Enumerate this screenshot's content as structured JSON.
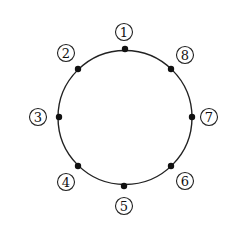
{
  "diagram": {
    "type": "circle-with-labeled-points",
    "circle": {
      "cx": 125,
      "cy": 117.5,
      "r": 67,
      "stroke": "#222222"
    },
    "points": [
      {
        "id": "1",
        "label": "1",
        "x": 125,
        "y": 49,
        "lx": 124,
        "ly": 32
      },
      {
        "id": "2",
        "label": "2",
        "x": 78,
        "y": 69,
        "lx": 66,
        "ly": 53
      },
      {
        "id": "3",
        "label": "3",
        "x": 59,
        "y": 117,
        "lx": 38,
        "ly": 117
      },
      {
        "id": "4",
        "label": "4",
        "x": 78,
        "y": 166,
        "lx": 66,
        "ly": 182
      },
      {
        "id": "5",
        "label": "5",
        "x": 124,
        "y": 186,
        "lx": 124,
        "ly": 206
      },
      {
        "id": "6",
        "label": "6",
        "x": 171,
        "y": 166,
        "lx": 185,
        "ly": 181
      },
      {
        "id": "7",
        "label": "7",
        "x": 192,
        "y": 117,
        "lx": 209,
        "ly": 117
      },
      {
        "id": "8",
        "label": "8",
        "x": 171,
        "y": 69,
        "lx": 185,
        "ly": 55
      }
    ]
  }
}
